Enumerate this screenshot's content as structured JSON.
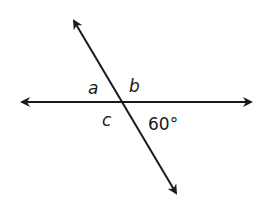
{
  "diagram": {
    "type": "intersecting-lines-angles",
    "line_color": "#1a1a1a",
    "background": "#ffffff",
    "lines": [
      {
        "name": "horizontal-line",
        "from": [
          20,
          102
        ],
        "to": [
          253,
          102
        ],
        "arrows": "both"
      },
      {
        "name": "transversal-line",
        "from": [
          73,
          19
        ],
        "to": [
          177,
          195
        ],
        "arrows": "both"
      }
    ],
    "intersection": [
      122,
      102
    ],
    "labels": {
      "angle_a": "a",
      "angle_b": "b",
      "angle_c": "c",
      "given_angle": "60°"
    }
  }
}
